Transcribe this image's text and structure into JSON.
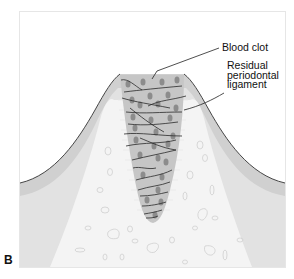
{
  "figure": {
    "panel_letter": "B",
    "labels": {
      "blood_clot": "Blood clot",
      "residual_pdl": [
        "Residual",
        "periodontal",
        "ligament"
      ]
    },
    "colors": {
      "background": "#ffffff",
      "frame": "#e6e6e6",
      "gingiva_outer": "#cfcfcf",
      "gingiva_inner": "#e4e4e4",
      "bone": "#f4f4f4",
      "bone_marrow_outline": "#d2d2d2",
      "clot_fill": "#c8c8c8",
      "clot_cells": "#8a8a8a",
      "fibrin_strands": "#2a2a2a",
      "pdl_hatching": "#eeeeee",
      "outline": "#333333"
    }
  }
}
